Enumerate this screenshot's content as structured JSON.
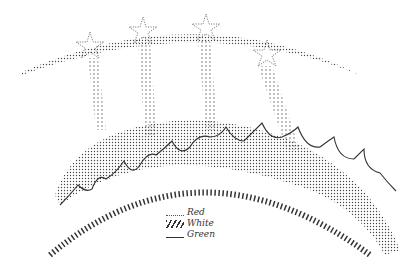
{
  "diagram": {
    "type": "embroidery pattern / stitch diagram",
    "elements": [
      "dotted arc with four stars",
      "dotted vertical stripes",
      "stippled hill band with scalloped edge",
      "hatched arc"
    ],
    "star_count": 4
  },
  "legend": {
    "items": [
      {
        "symbol": "dotted-line",
        "label": "Red"
      },
      {
        "symbol": "hatched-line",
        "label": "White"
      },
      {
        "symbol": "tick-line",
        "label": "Green"
      }
    ]
  },
  "colors": {
    "ink": "#333333",
    "background": "#ffffff"
  }
}
